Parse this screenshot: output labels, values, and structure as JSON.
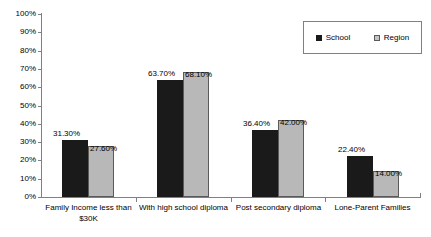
{
  "chart_data": {
    "type": "bar",
    "title": "",
    "subtitle": "",
    "xlabel": "",
    "ylabel": "",
    "ylim": [
      0,
      100
    ],
    "grid": false,
    "legend_position": "top-right",
    "categories": [
      "Family Income less than $30K",
      "With high school diploma",
      "Post secondary diploma",
      "Lone-Parent Families"
    ],
    "ytick_labels": [
      "0%",
      "10%",
      "20%",
      "30%",
      "40%",
      "50%",
      "60%",
      "70%",
      "80%",
      "90%",
      "100%"
    ],
    "ytick_values": [
      0,
      10,
      20,
      30,
      40,
      50,
      60,
      70,
      80,
      90,
      100
    ],
    "series": [
      {
        "name": "School",
        "color": "#1a1a1a",
        "values": [
          31.3,
          63.7,
          36.4,
          22.4
        ],
        "data_labels": [
          "31.30%",
          "63.70%",
          "36.40%",
          "22.40%"
        ]
      },
      {
        "name": "Region",
        "color": "#b8b8b8",
        "values": [
          27.6,
          68.1,
          42.0,
          14.0
        ],
        "data_labels": [
          "27.60%",
          "68.10%",
          "42.00%",
          "14.00%"
        ]
      }
    ]
  },
  "legend": {
    "items": [
      {
        "label": "School",
        "swatch": "school-swatch"
      },
      {
        "label": "Region",
        "swatch": "region-swatch"
      }
    ]
  },
  "axis": {
    "y_labels": [
      "100%",
      "90%",
      "80%",
      "70%",
      "60%",
      "50%",
      "40%",
      "30%",
      "20%",
      "10%",
      "0%"
    ],
    "x_labels": [
      "Family Income less than $30K",
      "With high school diploma",
      "Post secondary diploma",
      "Lone-Parent Families"
    ]
  }
}
